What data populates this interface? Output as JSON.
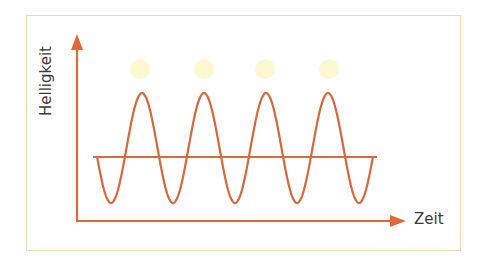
{
  "diagram": {
    "y_axis_label": "Helligkeit",
    "x_axis_label": "Zeit",
    "colors": {
      "axis": "#e06a35",
      "wave": "#d2693f",
      "baseline": "#e06a35",
      "light_dots": "#fdf8d0",
      "frame": "#f3d9b8",
      "text": "#3a3a3a"
    },
    "light_dots_count": 4,
    "wave_peaks_count": 4
  },
  "chart_data": {
    "type": "line",
    "title": "",
    "xlabel": "Zeit",
    "ylabel": "Helligkeit",
    "series": [
      {
        "name": "Helligkeit (oscillating)",
        "shape": "sine",
        "periods": 4,
        "relative_amplitude": 1.0
      },
      {
        "name": "Mittelwert",
        "shape": "constant",
        "relative_value": 0.0
      }
    ],
    "annotations": [
      "4 light dots above wave peaks"
    ],
    "grid": false
  }
}
